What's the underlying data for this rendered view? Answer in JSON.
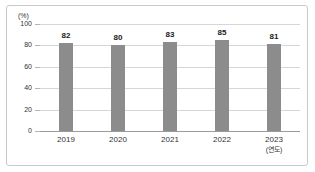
{
  "chart_data": {
    "type": "bar",
    "title": "",
    "xlabel": "(연도)",
    "ylabel": "(%)",
    "categories": [
      "2019",
      "2020",
      "2021",
      "2022",
      "2023"
    ],
    "values": [
      82,
      80,
      83,
      85,
      81
    ],
    "ylim": [
      0,
      100
    ],
    "yticks": [
      0,
      20,
      40,
      60,
      80,
      100
    ],
    "ytick_labels": [
      "0",
      "20",
      "40",
      "60",
      "80",
      "100"
    ],
    "grid": true,
    "legend": false,
    "series": [
      {
        "name": "",
        "values": [
          82,
          80,
          83,
          85,
          81
        ],
        "color": "#8c8c8c"
      }
    ],
    "data_labels": [
      "82",
      "80",
      "83",
      "85",
      "81"
    ],
    "colors": {
      "bar": "#8c8c8c",
      "gridline": "#d6d6d6",
      "baseline": "#9a9a9a",
      "border": "#c9c9c9",
      "text": "#333333",
      "label_text": "#1a1a1a",
      "background": "#ffffff"
    }
  }
}
